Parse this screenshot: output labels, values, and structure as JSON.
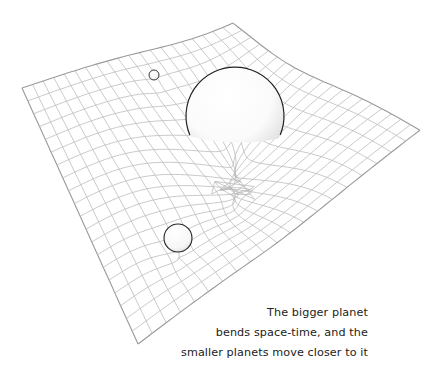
{
  "diagram": {
    "grid": {
      "corners": {
        "top": [
          233,
          17
        ],
        "right": [
          420,
          130
        ],
        "bottom": [
          138,
          344
        ],
        "left": [
          22,
          88
        ]
      },
      "cells_u": 20,
      "cells_v": 20,
      "line_color": "#b8b8b8",
      "border_color": "#9a9a9a"
    },
    "planets": [
      {
        "name": "big-planet",
        "cx": 235,
        "cy": 116,
        "r": 49,
        "clip_bottom": 143
      },
      {
        "name": "small-planet-top",
        "cx": 154,
        "cy": 75,
        "r": 5
      },
      {
        "name": "small-planet-bottom",
        "cx": 178,
        "cy": 238,
        "r": 14
      }
    ],
    "outline_color": "#222222"
  },
  "caption": {
    "lines": [
      "The bigger planet",
      "bends space-time, and the",
      "smaller planets move closer to it"
    ]
  }
}
